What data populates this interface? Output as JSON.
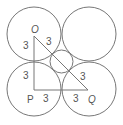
{
  "diagram": {
    "stroke_color": "#777777",
    "circles": [
      {
        "name": "top-left",
        "cx": 34,
        "cy": 34,
        "r": 27
      },
      {
        "name": "top-right",
        "cx": 89,
        "cy": 34,
        "r": 27
      },
      {
        "name": "bottom-left",
        "cx": 34,
        "cy": 89,
        "r": 27
      },
      {
        "name": "bottom-right",
        "cx": 89,
        "cy": 89,
        "r": 27
      },
      {
        "name": "center",
        "cx": 61.5,
        "cy": 61.5,
        "r": 11.5
      }
    ],
    "points": {
      "O": {
        "label": "O",
        "x": 34,
        "y": 36
      },
      "P": {
        "label": "P",
        "x": 34,
        "y": 90
      },
      "Q": {
        "label": "Q",
        "x": 88,
        "y": 90
      }
    },
    "segment_labels": {
      "op_upper": "3",
      "op_lower": "3",
      "oq_upper": "3",
      "oq_lower": "3",
      "pq_left": "3",
      "pq_right": "3"
    }
  }
}
